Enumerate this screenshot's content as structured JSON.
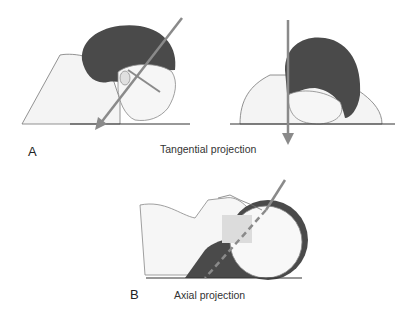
{
  "figure": {
    "panel_a": {
      "letter": "A",
      "caption": "Tangential projection",
      "views": [
        "lateral prone head with oblique beam",
        "prone head frontal view with vertical beam"
      ]
    },
    "panel_b": {
      "letter": "B",
      "caption": "Axial projection",
      "views": [
        "supine head with oblique beam (dashed through skull)"
      ]
    },
    "colors": {
      "beam": "#8a8a8a",
      "hair": "#4a4a4a",
      "skin": "#f2f2f2",
      "table": "#333333"
    }
  }
}
